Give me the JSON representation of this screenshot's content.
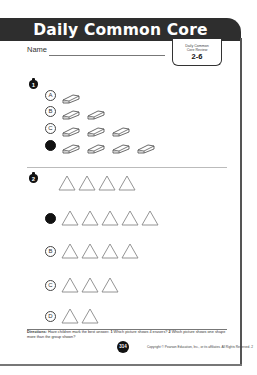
{
  "header": {
    "title": "Daily Common Core Review"
  },
  "name_label": "Name",
  "badge": {
    "line1": "Daily Common",
    "line2": "Core Review",
    "number": "2-6"
  },
  "questions": [
    {
      "number": "1",
      "shape": "eraser",
      "options": [
        {
          "letter": "A",
          "count": 1,
          "selected": false
        },
        {
          "letter": "B",
          "count": 2,
          "selected": false
        },
        {
          "letter": "C",
          "count": 3,
          "selected": false
        },
        {
          "letter": "D",
          "count": 4,
          "selected": true
        }
      ]
    },
    {
      "number": "2",
      "shape": "triangle",
      "group_count": 4,
      "options": [
        {
          "letter": "A",
          "count": 5,
          "selected": true
        },
        {
          "letter": "B",
          "count": 4,
          "selected": false
        },
        {
          "letter": "C",
          "count": 3,
          "selected": false
        },
        {
          "letter": "D",
          "count": 2,
          "selected": false
        }
      ]
    }
  ],
  "directions": {
    "label": "Directions:",
    "text": "Have children mark the best answer.",
    "q1_num": "1",
    "q1_text": "Which picture shows 4 erasers?",
    "q2_num": "2",
    "q2_text": "Which picture shows one shape more than the group shown?"
  },
  "footer": {
    "page_number": "314",
    "copyright": "Copyright © Pearson Education, Inc., or its affiliates. All Rights Reserved. 2"
  },
  "colors": {
    "header_bg": "#2e2e2e",
    "header_text": "#ffffff",
    "selected_fill": "#111111"
  }
}
